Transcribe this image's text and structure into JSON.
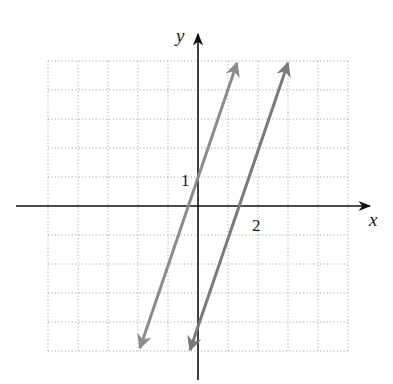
{
  "chart_data": {
    "type": "line",
    "title": "",
    "xlabel": "x",
    "ylabel": "y",
    "xlim": [
      -5,
      5
    ],
    "ylim": [
      -5,
      5
    ],
    "grid": true,
    "grid_style": "dotted",
    "tick_labels": [
      {
        "axis": "y",
        "value": 1,
        "label": "1"
      },
      {
        "axis": "x",
        "value": 2,
        "label": "2"
      }
    ],
    "series": [
      {
        "name": "line-1",
        "equation": "y = 3x + 1",
        "slope": 3,
        "intercept": 1,
        "x": [
          -1.97,
          1.32
        ],
        "y": [
          -4.9,
          4.97
        ],
        "arrows": "both",
        "color": "#8c8c8c"
      },
      {
        "name": "line-2",
        "equation": "y = 3x - 4",
        "slope": 3,
        "intercept": -4,
        "x": [
          -0.32,
          2.99
        ],
        "y": [
          -4.97,
          4.97
        ],
        "arrows": "both",
        "color": "#7a7a7a"
      }
    ],
    "legend": null
  },
  "labels": {
    "x_axis": "x",
    "y_axis": "y",
    "tick_y1": "1",
    "tick_x2": "2"
  },
  "colors": {
    "axis": "#111111",
    "grid": "#a8a8a8",
    "line1": "#8c8c8c",
    "line2": "#7a7a7a"
  }
}
